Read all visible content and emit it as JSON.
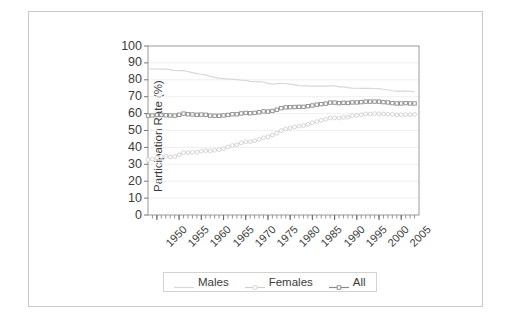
{
  "figure": {
    "frame_color": "#c9c9c9",
    "background": "#ffffff"
  },
  "chart_data": {
    "type": "line",
    "title": "",
    "subtitle": "",
    "xlabel": "",
    "ylabel": "Participation Rate (%)",
    "xlim": [
      1948,
      2009
    ],
    "ylim": [
      0,
      100
    ],
    "ytick_step": 10,
    "xtick_step_major": 5,
    "xtick_step_minor": 1,
    "grid": true,
    "grid_color": "#efefef",
    "legend_position": "below-plot-center",
    "ytick_labels": [
      "100",
      "90",
      "80",
      "70",
      "60",
      "50",
      "40",
      "30",
      "20",
      "10",
      "0"
    ],
    "ytick_values": [
      100,
      90,
      80,
      70,
      60,
      50,
      40,
      30,
      20,
      10,
      0
    ],
    "xtick_labels": [
      "1950",
      "1955",
      "1960",
      "1965",
      "1970",
      "1975",
      "1980",
      "1985",
      "1990",
      "1995",
      "2000",
      "2005"
    ],
    "xtick_values": [
      1950,
      1955,
      1960,
      1965,
      1970,
      1975,
      1980,
      1985,
      1990,
      1995,
      2000,
      2005
    ],
    "x": [
      1948,
      1949,
      1950,
      1951,
      1952,
      1953,
      1954,
      1955,
      1956,
      1957,
      1958,
      1959,
      1960,
      1961,
      1962,
      1963,
      1964,
      1965,
      1966,
      1967,
      1968,
      1969,
      1970,
      1971,
      1972,
      1973,
      1974,
      1975,
      1976,
      1977,
      1978,
      1979,
      1980,
      1981,
      1982,
      1983,
      1984,
      1985,
      1986,
      1987,
      1988,
      1989,
      1990,
      1991,
      1992,
      1993,
      1994,
      1995,
      1996,
      1997,
      1998,
      1999,
      2000,
      2001,
      2002,
      2003,
      2004,
      2005,
      2006,
      2007,
      2008
    ],
    "series": [
      {
        "name": "Males",
        "color": "#d8d8d8",
        "marker": "none",
        "values": [
          86.6,
          86.4,
          86.4,
          86.3,
          86.3,
          86.0,
          85.5,
          85.4,
          85.5,
          84.8,
          84.2,
          83.7,
          83.3,
          82.9,
          82.0,
          81.4,
          81.0,
          80.7,
          80.4,
          80.4,
          80.1,
          79.8,
          79.7,
          79.1,
          78.9,
          78.8,
          78.7,
          77.9,
          77.5,
          77.7,
          77.9,
          77.8,
          77.4,
          77.0,
          76.6,
          76.4,
          76.4,
          76.3,
          76.3,
          76.2,
          76.2,
          76.4,
          76.4,
          75.8,
          75.8,
          75.4,
          75.1,
          75.0,
          74.9,
          75.0,
          74.9,
          74.7,
          74.8,
          74.4,
          74.1,
          73.5,
          73.3,
          73.3,
          73.5,
          73.2,
          73.0
        ]
      },
      {
        "name": "Females",
        "color": "#d0d0d0",
        "marker": "open-circle",
        "values": [
          32.7,
          33.1,
          33.9,
          34.6,
          34.7,
          34.4,
          34.6,
          35.7,
          36.9,
          36.9,
          37.1,
          37.1,
          37.7,
          38.1,
          37.9,
          38.3,
          38.7,
          39.3,
          40.3,
          41.1,
          41.6,
          42.7,
          43.3,
          43.4,
          43.9,
          44.7,
          45.7,
          46.3,
          47.3,
          48.4,
          50.0,
          50.9,
          51.5,
          52.1,
          52.6,
          52.9,
          53.6,
          54.5,
          55.3,
          56.0,
          56.6,
          57.4,
          57.5,
          57.4,
          57.8,
          57.9,
          58.8,
          58.9,
          59.3,
          59.8,
          59.8,
          60.0,
          59.9,
          59.8,
          59.6,
          59.5,
          59.2,
          59.3,
          59.4,
          59.3,
          59.5
        ]
      },
      {
        "name": "All",
        "color": "#8c8c8c",
        "marker": "open-square",
        "values": [
          58.8,
          58.9,
          59.2,
          59.2,
          59.0,
          58.9,
          58.8,
          59.3,
          60.0,
          59.6,
          59.5,
          59.3,
          59.4,
          59.3,
          58.8,
          58.7,
          58.7,
          58.9,
          59.2,
          59.6,
          59.6,
          60.1,
          60.4,
          60.2,
          60.4,
          60.8,
          61.3,
          61.2,
          61.6,
          62.3,
          63.2,
          63.7,
          63.8,
          63.9,
          64.0,
          64.0,
          64.4,
          64.8,
          65.3,
          65.6,
          65.9,
          66.5,
          66.5,
          66.2,
          66.4,
          66.3,
          66.6,
          66.6,
          66.8,
          67.1,
          67.1,
          67.1,
          67.1,
          66.8,
          66.6,
          66.2,
          66.0,
          66.0,
          66.2,
          66.0,
          66.0
        ]
      }
    ]
  },
  "legend": {
    "entries": [
      {
        "label": "Males",
        "marker": "line"
      },
      {
        "label": "Females",
        "marker": "open-circle"
      },
      {
        "label": "All",
        "marker": "open-square"
      }
    ]
  }
}
